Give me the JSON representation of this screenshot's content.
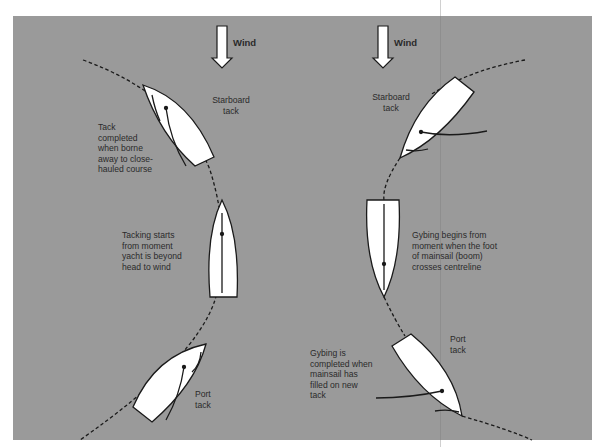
{
  "colors": {
    "background": "#9a9a9a",
    "boat_fill": "#ffffff",
    "line": "#1a1a1a",
    "text": "#2a2a2a"
  },
  "diagram": {
    "left": {
      "title": "Tacking",
      "wind_label": "Wind",
      "labels": {
        "starboard_tack": "Starboard\ntack",
        "tack_completed": "Tack\ncompleted\nwhen borne\naway to close-\nhauled course",
        "tacking_starts": "Tacking starts\nfrom moment\nyacht is beyond\nhead to wind",
        "port_tack": "Port\ntack"
      }
    },
    "right": {
      "title": "Gybing",
      "wind_label": "Wind",
      "labels": {
        "starboard_tack": "Starboard\ntack",
        "gybing_begins": "Gybing begins from\nmoment when the foot\nof mainsail (boom)\ncrosses centreline",
        "gybing_completed": "Gybing is\ncompleted when\nmainsail has\nfilled on new\ntack",
        "port_tack": "Port\ntack"
      }
    },
    "icons": [
      "wind-arrow-icon",
      "boat-icon",
      "course-path-dashed"
    ]
  }
}
